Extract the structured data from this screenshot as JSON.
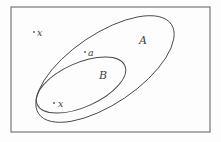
{
  "figure": {
    "kind": "set-venn-diagram",
    "background_color": "#fdfdfd",
    "line_color": "#4c4947",
    "frame_color": "#6e6b69",
    "text_color": "#43403f"
  },
  "universe": {
    "name": "universal-set-rectangle",
    "x": 11,
    "y": 7,
    "width": 199,
    "height": 125
  },
  "sets": [
    {
      "id": "set-a",
      "label": "A",
      "cx": 105,
      "cy": 69,
      "rx": 80,
      "ry": 35,
      "rotation": -34,
      "label_x": 143,
      "label_y": 44
    },
    {
      "id": "set-b",
      "label": "B",
      "cx": 81,
      "cy": 85,
      "rx": 48,
      "ry": 22,
      "rotation": -24,
      "label_x": 103,
      "label_y": 79
    }
  ],
  "points": [
    {
      "id": "point-x-inside-b",
      "label": "x",
      "dot_x": 54,
      "dot_y": 103,
      "label_x": 58,
      "label_y": 107,
      "region": "inside-B"
    },
    {
      "id": "point-a-inside-a",
      "label": "a",
      "dot_x": 85,
      "dot_y": 52,
      "label_x": 88,
      "label_y": 56,
      "region": "inside-A-outside-B"
    },
    {
      "id": "point-x-outside",
      "label": "x",
      "dot_x": 34,
      "dot_y": 32,
      "label_x": 37,
      "label_y": 36,
      "region": "outside-A"
    }
  ]
}
